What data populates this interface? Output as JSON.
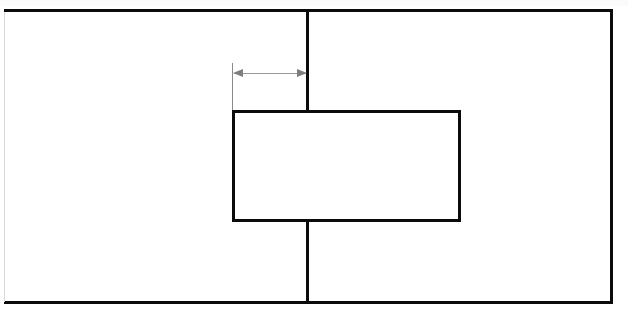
{
  "drawing": {
    "title": "Orthographic section view",
    "type": "technical-line-drawing",
    "background_color": "#ffffff",
    "line_color": "#0b0b0b",
    "faint_line_color": "#d8d8d8",
    "annotation_color": "#8a8a8a",
    "canvas": {
      "width": 628,
      "height": 315
    },
    "outer_rectangle": {
      "name": "outer boundary",
      "left": 4,
      "top": 9,
      "right": 613,
      "bottom": 304,
      "stroke_width": 3,
      "left_edge_visible": false
    },
    "center_line": {
      "name": "vertical parting line",
      "x": 308,
      "top": 9,
      "bottom": 304,
      "stroke_width": 3,
      "hidden_from": 110,
      "hidden_to": 222
    },
    "inner_rectangle": {
      "name": "projecting block",
      "left": 232,
      "top": 110,
      "right": 461,
      "bottom": 222,
      "stroke_width": 3,
      "fill": "#ffffff"
    },
    "dimension": {
      "name": "offset dimension",
      "label": "",
      "y": 73,
      "from_x": 232,
      "to_x": 308,
      "extension_line_x": 232,
      "extension_top": 63,
      "extension_bottom": 110,
      "arrow_heads": [
        "left",
        "right"
      ],
      "color": "#8a8a8a"
    }
  }
}
